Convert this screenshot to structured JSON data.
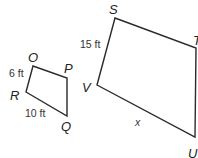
{
  "diagram": {
    "type": "similar-quadrilaterals",
    "small_quad": {
      "vertices": [
        {
          "name": "O",
          "x": 33,
          "y": 66,
          "label_x": 28,
          "label_y": 62
        },
        {
          "name": "P",
          "x": 67,
          "y": 78,
          "label_x": 64,
          "label_y": 73
        },
        {
          "name": "Q",
          "x": 67,
          "y": 116,
          "label_x": 61,
          "label_y": 131
        },
        {
          "name": "R",
          "x": 26,
          "y": 92,
          "label_x": 10,
          "label_y": 100
        }
      ],
      "measures": [
        {
          "side": "OR",
          "text": "6 ft",
          "x": 9,
          "y": 77
        },
        {
          "side": "RQ",
          "text": "10 ft",
          "x": 25,
          "y": 117
        }
      ]
    },
    "large_quad": {
      "vertices": [
        {
          "name": "S",
          "x": 115,
          "y": 18,
          "label_x": 109,
          "label_y": 14
        },
        {
          "name": "T",
          "x": 196,
          "y": 48,
          "label_x": 193,
          "label_y": 45
        },
        {
          "name": "U",
          "x": 195,
          "y": 137,
          "label_x": 188,
          "label_y": 158
        },
        {
          "name": "V",
          "x": 97,
          "y": 85,
          "label_x": 82,
          "label_y": 92
        }
      ],
      "measures": [
        {
          "side": "SV",
          "text": "15 ft",
          "x": 80,
          "y": 48
        },
        {
          "side": "VU",
          "text": "x",
          "x": 135,
          "y": 126
        }
      ]
    }
  }
}
